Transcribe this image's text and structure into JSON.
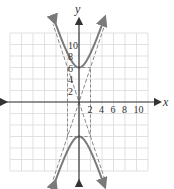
{
  "chart_data": {
    "type": "line",
    "title": "",
    "xlabel": "x",
    "ylabel": "y",
    "xlim": [
      -12,
      12
    ],
    "ylim": [
      -12,
      12
    ],
    "grid": true,
    "grid_step": 2,
    "x_tick_labels": [
      "2",
      "4",
      "6",
      "8",
      "10"
    ],
    "y_tick_labels": [
      "2",
      "4",
      "6",
      "8",
      "10"
    ],
    "legend": null,
    "series": [
      {
        "name": "hyperbola",
        "equation": "y^2/36 - x^2/4 = 1",
        "style": "solid",
        "color": "#7a7a7a",
        "vertices": [
          [
            0,
            6
          ],
          [
            0,
            -6
          ]
        ]
      },
      {
        "name": "asymptotes",
        "equations": [
          "y = 3x",
          "y = -3x"
        ],
        "style": "dashed",
        "color": "#8a8a8a"
      },
      {
        "name": "fundamental-rectangle",
        "corners": [
          [
            -2,
            6
          ],
          [
            2,
            6
          ],
          [
            2,
            -6
          ],
          [
            -2,
            -6
          ]
        ],
        "style": "dashed",
        "color": "#8a8a8a"
      }
    ]
  },
  "colors": {
    "grid": "#d9d9d9",
    "axis": "#333333",
    "curve": "#7a7a7a",
    "dashed": "#8a8a8a"
  }
}
